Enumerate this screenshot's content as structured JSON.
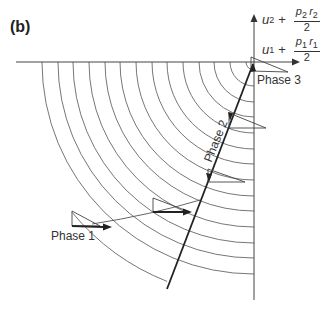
{
  "panel": {
    "label": "(b)"
  },
  "axes": {
    "vertical_label": {
      "var": "u",
      "sub": "2",
      "plus": "+",
      "num_p": "p",
      "num_p_sub": "2",
      "num_r": "r",
      "num_r_sub": "2",
      "den": "2"
    },
    "horizontal_label": {
      "var": "u",
      "sub": "1",
      "plus": "+",
      "num_p": "p",
      "num_p_sub": "1",
      "num_r": "r",
      "num_r_sub": "1",
      "den": "2"
    }
  },
  "phases": [
    {
      "id": "phase-1",
      "label": "Phase 1"
    },
    {
      "id": "phase-2",
      "label": "Phase 2"
    },
    {
      "id": "phase-3",
      "label": "Phase 3"
    }
  ],
  "geometry": {
    "center": [
      254,
      62
    ],
    "arc_radii": [
      8,
      24,
      40,
      55,
      71,
      87,
      102,
      118,
      134,
      149,
      165,
      181,
      196,
      212,
      236
    ],
    "line_color": "#555555",
    "thick_line_color": "#222222"
  }
}
